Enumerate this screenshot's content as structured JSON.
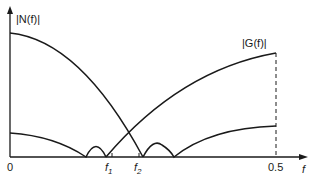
{
  "labels": {
    "y_axis_curve1": "|N(f)|",
    "curve2": "|G(f)|",
    "origin": "0",
    "f1": "f",
    "f1_sub": "1",
    "f2": "f",
    "f2_sub": "2",
    "x_tick_end": "0.5",
    "x_axis": "f"
  },
  "colors": {
    "line": "#1a1a1a",
    "background": "#ffffff"
  }
}
